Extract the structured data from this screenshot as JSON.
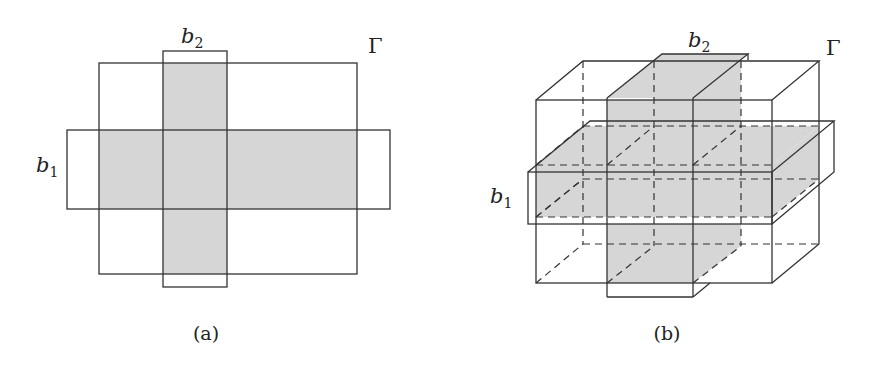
{
  "figure": {
    "colors": {
      "shade": "#d6d6d6",
      "line": "#333333",
      "background": "#ffffff"
    },
    "panels": [
      {
        "id": "a",
        "caption": "(a)",
        "view": "2D cross-section",
        "labels": {
          "b1": "b",
          "b1_sub": "1",
          "b2": "b",
          "b2_sub": "2",
          "gamma": "Γ"
        },
        "shapes": {
          "gamma_rect": {
            "x": 99,
            "y": 63,
            "w": 258,
            "h": 211
          },
          "b1_rect": {
            "x": 67,
            "y": 130,
            "w": 323,
            "h": 79
          },
          "b2_rect": {
            "x": 163,
            "y": 51,
            "w": 64,
            "h": 236
          },
          "shaded": "union of (b1 ∩ Γ) and (b2 ∩ Γ)"
        }
      },
      {
        "id": "b",
        "caption": "(b)",
        "view": "3D perspective",
        "labels": {
          "b1": "b",
          "b1_sub": "1",
          "b2": "b",
          "b2_sub": "2",
          "gamma": "Γ"
        },
        "shapes": {
          "gamma_box": {
            "front": {
              "x": 536,
              "y": 100,
              "w": 236,
              "h": 183
            },
            "depth": {
              "dx": 47,
              "dy": -39
            }
          },
          "b1_slab": {
            "front": {
              "x": 528,
              "y": 172,
              "w": 244,
              "h": 52
            },
            "depth": {
              "dx": 62,
              "dy": -51
            }
          },
          "b2_slab": {
            "front": {
              "x": 607,
              "y": 98,
              "w": 86,
              "h": 199
            },
            "depth": {
              "dx": 55,
              "dy": -44
            }
          },
          "shaded": "slabs b1 and b2 intersected with Γ"
        }
      }
    ]
  }
}
